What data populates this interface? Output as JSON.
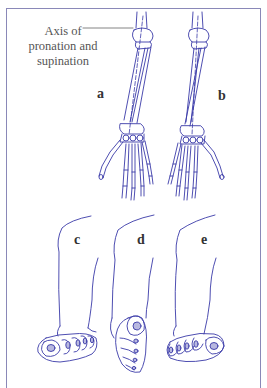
{
  "figure": {
    "axis_label": "Axis of pronation and supination",
    "axis_label_lines": [
      "Axis of",
      "pronation and",
      "supination"
    ],
    "panels": [
      {
        "id": "a",
        "label": "a",
        "subject": "forearm and hand skeleton, supinated"
      },
      {
        "id": "b",
        "label": "b",
        "subject": "forearm and hand skeleton, pronated"
      },
      {
        "id": "c",
        "label": "c",
        "subject": "lower leg and foot view"
      },
      {
        "id": "d",
        "label": "d",
        "subject": "lower leg and foot view"
      },
      {
        "id": "e",
        "label": "e",
        "subject": "lower leg and foot view"
      }
    ],
    "colors": {
      "line": "#3a3aa8",
      "frame": "#8a88b8",
      "text": "#444444",
      "nail_fill": "#b8b8e0"
    }
  }
}
